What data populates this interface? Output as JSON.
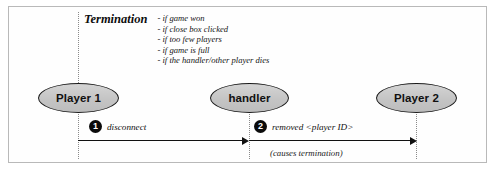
{
  "figure": {
    "border_color": "#b9b9b9",
    "background": "#ffffff"
  },
  "note": {
    "title": "Termination",
    "items": [
      "- if game won",
      "- if close box clicked",
      "- if too few players",
      "- if game is full",
      "- if the handler/other player dies"
    ]
  },
  "actors": [
    {
      "id": "player1",
      "label": "Player 1",
      "fill": "#c9c9c9"
    },
    {
      "id": "handler",
      "label": "handler",
      "fill": "#c9c9c9"
    },
    {
      "id": "player2",
      "label": "Player 2",
      "fill": "#c9c9c9"
    }
  ],
  "messages": [
    {
      "number": "1",
      "label": "disconnect",
      "from": "player1",
      "to": "handler"
    },
    {
      "number": "2",
      "label": "removed <player ID>",
      "from": "handler",
      "to": "player2"
    }
  ],
  "annotations": [
    {
      "text": "(causes termination)"
    }
  ]
}
